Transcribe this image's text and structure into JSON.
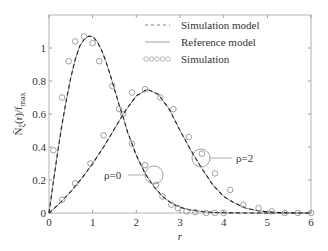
{
  "chart_data": {
    "type": "line",
    "title": "",
    "xlabel": "r",
    "ylabel": "N̄ξ(r)/fmax",
    "xlim": [
      0,
      6
    ],
    "ylim": [
      0,
      1.2
    ],
    "xticks": [
      "0",
      "1",
      "2",
      "3",
      "4",
      "5",
      "6"
    ],
    "yticks": [
      "0",
      "0.2",
      "0.4",
      "0.6",
      "0.8",
      "1"
    ],
    "grid": false,
    "legend_position": "upper right",
    "legend": [
      "Simulation model",
      "Reference model",
      "Simulation"
    ],
    "annotations": [
      {
        "text": "ρ=0",
        "circle_at": [
          2.4,
          0.23
        ]
      },
      {
        "text": "ρ=2",
        "circle_at": [
          3.45,
          0.33
        ]
      }
    ],
    "series": [
      {
        "name": "ρ=0",
        "curve": {
          "x": [
            0,
            0.1,
            0.2,
            0.3,
            0.4,
            0.5,
            0.6,
            0.7,
            0.8,
            0.9,
            1.0,
            1.1,
            1.2,
            1.3,
            1.4,
            1.5,
            1.6,
            1.7,
            1.8,
            1.9,
            2.0,
            2.2,
            2.4,
            2.6,
            2.8,
            3.0,
            3.2,
            3.4,
            3.6,
            3.8,
            4.0,
            4.5,
            5.0,
            5.5,
            6.0
          ],
          "y": [
            0,
            0.19,
            0.37,
            0.54,
            0.69,
            0.82,
            0.93,
            1.01,
            1.05,
            1.07,
            1.07,
            1.04,
            0.99,
            0.92,
            0.84,
            0.75,
            0.66,
            0.58,
            0.49,
            0.42,
            0.35,
            0.24,
            0.16,
            0.1,
            0.06,
            0.035,
            0.02,
            0.012,
            0.006,
            0.003,
            0.0015,
            0,
            0,
            0,
            0
          ]
        },
        "points": {
          "x": [
            0.1,
            0.3,
            0.45,
            0.6,
            0.8,
            1.0,
            1.15,
            1.45,
            1.7,
            1.9,
            2.2,
            2.45,
            2.6,
            2.8,
            2.95,
            3.15,
            3.35,
            3.6,
            3.8,
            4.0
          ],
          "y": [
            0.38,
            0.7,
            0.92,
            1.04,
            1.07,
            1.03,
            0.92,
            0.77,
            0.6,
            0.42,
            0.29,
            0.17,
            0.1,
            0.05,
            0.03,
            0.01,
            0.005,
            0.0,
            0.0,
            0.0
          ]
        }
      },
      {
        "name": "ρ=2",
        "curve": {
          "x": [
            0,
            0.25,
            0.5,
            0.75,
            1.0,
            1.25,
            1.5,
            1.75,
            2.0,
            2.25,
            2.5,
            2.75,
            3.0,
            3.25,
            3.5,
            3.75,
            4.0,
            4.25,
            4.5,
            4.75,
            5.0,
            5.25,
            5.5,
            5.75,
            6.0
          ],
          "y": [
            0,
            0.06,
            0.13,
            0.21,
            0.3,
            0.4,
            0.51,
            0.62,
            0.71,
            0.75,
            0.72,
            0.63,
            0.5,
            0.38,
            0.27,
            0.17,
            0.1,
            0.06,
            0.03,
            0.015,
            0.007,
            0.003,
            0.001,
            0,
            0
          ]
        },
        "points": {
          "x": [
            0.3,
            0.6,
            0.95,
            1.25,
            1.6,
            1.9,
            2.2,
            2.55,
            2.85,
            3.2,
            3.5,
            3.8,
            4.15,
            4.45,
            4.8,
            5.1,
            5.4,
            5.7,
            6.0
          ],
          "y": [
            0.08,
            0.18,
            0.3,
            0.47,
            0.63,
            0.73,
            0.75,
            0.7,
            0.63,
            0.46,
            0.36,
            0.24,
            0.14,
            0.05,
            0.03,
            0.01,
            0.0,
            0.0,
            0.0
          ]
        }
      }
    ]
  },
  "legend": {
    "items": [
      "Simulation model",
      "Reference model",
      "Simulation"
    ]
  },
  "axes": {
    "xlabel": "r",
    "ylabel_main": "N̄",
    "ylabel_rest": "(r)/f",
    "ylabel_sub1": "ξ",
    "ylabel_sub2": "max"
  },
  "annotations": {
    "rho0": "ρ=0",
    "rho2": "ρ=2"
  }
}
